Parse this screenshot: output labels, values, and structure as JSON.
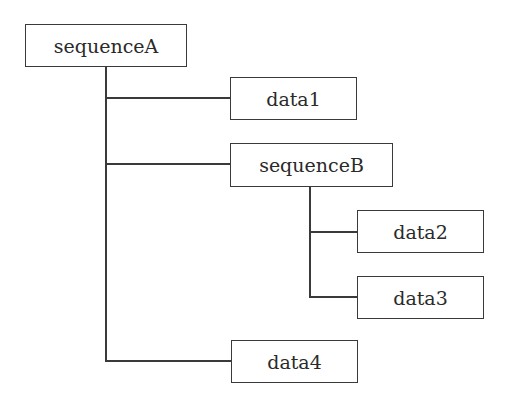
{
  "diagram": {
    "type": "tree",
    "nodes": [
      {
        "id": "sequenceA",
        "label": "sequenceA",
        "parent": null
      },
      {
        "id": "data1",
        "label": "data1",
        "parent": "sequenceA"
      },
      {
        "id": "sequenceB",
        "label": "sequenceB",
        "parent": "sequenceA"
      },
      {
        "id": "data2",
        "label": "data2",
        "parent": "sequenceB"
      },
      {
        "id": "data3",
        "label": "data3",
        "parent": "sequenceB"
      },
      {
        "id": "data4",
        "label": "data4",
        "parent": "sequenceA"
      }
    ],
    "colors": {
      "stroke": "#3a3a3a",
      "text": "#2a2a2a",
      "background": "#ffffff"
    }
  }
}
